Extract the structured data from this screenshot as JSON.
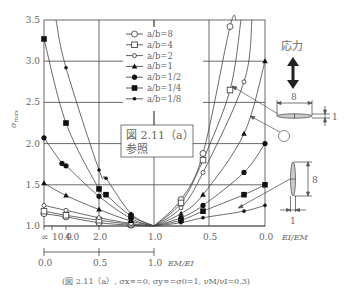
{
  "chart_data": {
    "type": "line",
    "title": "",
    "ylabel": "σmax",
    "ylim": [
      1.0,
      3.5
    ],
    "yticks": [
      "1.0",
      "1.5",
      "2.0",
      "2.5",
      "3.0",
      "3.5"
    ],
    "x_axis_top": {
      "label": "EI/EM",
      "left_ticks": [
        "∞",
        "10.0",
        "4.0",
        "2.0",
        "1.0"
      ],
      "right_ticks": [
        "0.5",
        "0.0"
      ]
    },
    "x_axis_bottom": {
      "label": "EM/EI",
      "ticks": [
        "0.0",
        "0.5",
        "1.0"
      ]
    },
    "grid": true,
    "legend_position": "upper-center",
    "series": [
      {
        "name": "a/b=8",
        "marker": "open-circle-large",
        "left": [
          [
            44,
            1.15
          ],
          [
            66,
            1.11
          ],
          [
            99,
            1.04
          ],
          [
            131,
            1.01
          ],
          [
            154,
            1.0
          ]
        ],
        "right": [
          [
            154,
            1.0
          ],
          [
            181,
            1.32
          ],
          [
            203,
            1.88
          ],
          [
            230,
            3.42
          ],
          [
            236,
            3.5
          ]
        ]
      },
      {
        "name": "a/b=4",
        "marker": "open-square",
        "left": [
          [
            44,
            1.18
          ],
          [
            66,
            1.13
          ],
          [
            99,
            1.07
          ],
          [
            131,
            1.02
          ],
          [
            154,
            1.0
          ]
        ],
        "right": [
          [
            154,
            1.0
          ],
          [
            181,
            1.28
          ],
          [
            203,
            1.8
          ],
          [
            230,
            2.65
          ],
          [
            241,
            3.5
          ]
        ]
      },
      {
        "name": "a/b=2",
        "marker": "open-circle-small",
        "left": [
          [
            44,
            1.25
          ],
          [
            66,
            1.19
          ],
          [
            99,
            1.1
          ],
          [
            131,
            1.03
          ],
          [
            154,
            1.0
          ]
        ],
        "right": [
          [
            154,
            1.0
          ],
          [
            181,
            1.22
          ],
          [
            203,
            1.65
          ],
          [
            244,
            2.75
          ],
          [
            252,
            3.5
          ]
        ]
      },
      {
        "name": "a/b=1",
        "marker": "filled-triangle",
        "left": [
          [
            44,
            1.52
          ],
          [
            66,
            1.37
          ],
          [
            99,
            1.2
          ],
          [
            131,
            1.06
          ],
          [
            154,
            1.0
          ]
        ],
        "right": [
          [
            154,
            1.0
          ],
          [
            181,
            1.15
          ],
          [
            203,
            1.38
          ],
          [
            244,
            2.12
          ],
          [
            265,
            3.0
          ]
        ]
      },
      {
        "name": "a/b=1/2",
        "marker": "filled-circle",
        "left": [
          [
            44,
            2.07
          ],
          [
            62,
            1.76
          ],
          [
            66,
            1.73
          ],
          [
            99,
            1.36
          ],
          [
            131,
            1.09
          ],
          [
            154,
            1.0
          ]
        ],
        "right": [
          [
            154,
            1.0
          ],
          [
            181,
            1.1
          ],
          [
            203,
            1.25
          ],
          [
            244,
            1.65
          ],
          [
            265,
            2.0
          ]
        ]
      },
      {
        "name": "a/b=1/4",
        "marker": "filled-square",
        "left": [
          [
            44,
            3.27
          ],
          [
            66,
            2.25
          ],
          [
            99,
            1.45
          ],
          [
            106,
            1.38
          ],
          [
            131,
            1.12
          ],
          [
            154,
            1.0
          ]
        ],
        "right": [
          [
            154,
            1.0
          ],
          [
            181,
            1.07
          ],
          [
            203,
            1.18
          ],
          [
            244,
            1.38
          ],
          [
            265,
            1.5
          ]
        ]
      },
      {
        "name": "a/b=1/8",
        "marker": "filled-diamond-small",
        "left": [
          [
            56,
            3.5
          ],
          [
            66,
            2.92
          ],
          [
            99,
            1.68
          ],
          [
            106,
            1.58
          ],
          [
            131,
            1.15
          ],
          [
            154,
            1.0
          ]
        ],
        "right": [
          [
            154,
            1.0
          ],
          [
            181,
            1.04
          ],
          [
            203,
            1.1
          ],
          [
            244,
            1.18
          ],
          [
            265,
            1.25
          ]
        ]
      }
    ]
  },
  "legend": {
    "items": [
      "a/b=8",
      "a/b=4",
      "a/b=2",
      "a/b=1",
      "a/b=1/2",
      "a/b=1/4",
      "a/b=1/8"
    ]
  },
  "note": {
    "line1": "図 2.11（a）",
    "line2": "参照"
  },
  "inset": {
    "stress_label": "応力",
    "horizontal_ellipse": {
      "width_label": "8",
      "height_label": "1"
    },
    "vertical_ellipse": {
      "height_label": "8",
      "width_label": "1"
    }
  },
  "caption": "(図 2.11（a）, σx∞=0, σy∞=σ0=1, νM/νI=0.3)"
}
